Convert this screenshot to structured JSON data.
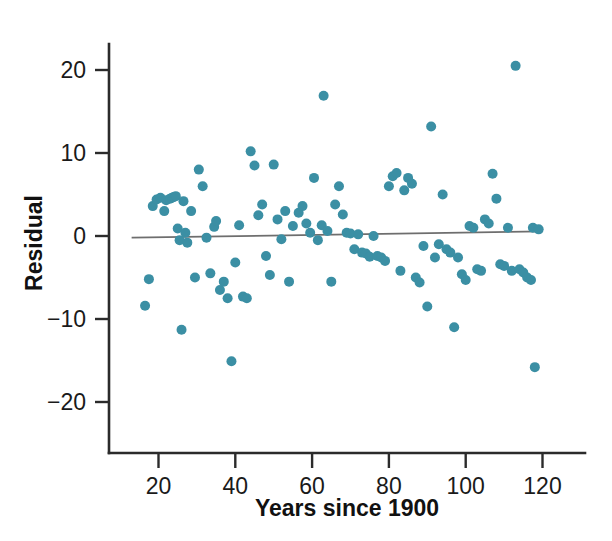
{
  "chart_data": {
    "type": "scatter",
    "title": "",
    "xlabel": "Years since 1900",
    "ylabel": "Residual",
    "xlim": [
      10,
      128
    ],
    "ylim": [
      -25,
      24
    ],
    "xticks": [
      20,
      40,
      60,
      80,
      100,
      120
    ],
    "yticks": [
      20,
      10,
      0,
      -10,
      -20
    ],
    "xtick_labels": [
      "20",
      "40",
      "60",
      "80",
      "100",
      "120"
    ],
    "ytick_labels": [
      "20",
      "10",
      "0",
      "−10",
      "−20"
    ],
    "grid": false,
    "legend": null,
    "marker_color": "#3b8fa4",
    "marker_size": 10,
    "reference_line": {
      "label": "zero-residual line",
      "color": "#6e6e6e",
      "x_start": 13,
      "x_end": 120,
      "y_start": -0.2,
      "y_end": 0.55
    },
    "x": [
      16.5,
      17.5,
      18.5,
      19.5,
      20.5,
      21.5,
      22.0,
      23.0,
      23.5,
      24.0,
      24.5,
      25.0,
      25.5,
      26.0,
      26.5,
      27.0,
      27.5,
      28.5,
      29.5,
      30.5,
      31.5,
      32.5,
      33.5,
      34.5,
      35.0,
      36.0,
      37.0,
      38.0,
      39.0,
      40.0,
      41.0,
      42.0,
      43.0,
      44.0,
      45.0,
      46.0,
      47.0,
      48.0,
      49.0,
      50.0,
      51.0,
      52.0,
      53.0,
      54.0,
      55.0,
      56.5,
      57.5,
      58.5,
      59.5,
      60.5,
      61.5,
      62.5,
      63.0,
      64.0,
      65.0,
      66.0,
      67.0,
      68.0,
      69.0,
      70.0,
      71.0,
      72.0,
      73.0,
      74.0,
      75.0,
      76.0,
      77.0,
      78.0,
      79.0,
      80.0,
      81.0,
      82.0,
      83.0,
      84.0,
      85.0,
      86.0,
      87.0,
      88.0,
      89.0,
      90.0,
      91.0,
      92.0,
      93.0,
      94.0,
      95.0,
      96.0,
      97.0,
      98.0,
      99.0,
      100.0,
      101.0,
      102.0,
      103.0,
      104.0,
      105.0,
      106.0,
      107.0,
      108.0,
      109.0,
      110.0,
      111.0,
      112.0,
      113.0,
      114.0,
      115.0,
      116.0,
      117.0,
      117.5,
      118.0,
      119.0
    ],
    "y": [
      -8.4,
      -5.2,
      3.6,
      4.4,
      4.6,
      3.0,
      4.3,
      4.5,
      4.6,
      4.7,
      4.8,
      0.9,
      -0.5,
      -11.3,
      4.2,
      0.4,
      -0.8,
      3.0,
      -5.0,
      8.0,
      6.0,
      -0.2,
      -4.5,
      1.1,
      1.8,
      -6.5,
      -5.5,
      -7.5,
      -15.1,
      -3.2,
      1.3,
      -7.3,
      -7.5,
      10.2,
      8.5,
      2.5,
      3.8,
      -2.4,
      -4.7,
      8.6,
      2.0,
      -0.4,
      3.0,
      -5.5,
      1.2,
      2.8,
      3.6,
      1.5,
      0.4,
      7.0,
      -0.5,
      1.3,
      16.9,
      0.6,
      -5.5,
      3.8,
      6.0,
      2.6,
      0.4,
      0.3,
      -1.6,
      0.2,
      -2.0,
      -2.1,
      -2.5,
      0.0,
      -2.4,
      -2.6,
      -3.0,
      6.0,
      7.2,
      7.6,
      -4.2,
      5.5,
      7.0,
      6.3,
      -5.0,
      -5.6,
      -1.2,
      -8.5,
      13.2,
      -2.6,
      -1.0,
      5.0,
      -1.6,
      -2.0,
      -11.0,
      -2.6,
      -4.6,
      -5.3,
      1.2,
      1.0,
      -4.0,
      -4.2,
      2.0,
      1.5,
      7.5,
      4.5,
      -3.4,
      -3.6,
      1.0,
      -4.2,
      20.5,
      -4.0,
      -4.4,
      -5.0,
      -5.3,
      1.0,
      -15.8,
      0.8
    ]
  },
  "figure": {
    "axis_color": "#2b2b2b",
    "background": "#ffffff"
  }
}
